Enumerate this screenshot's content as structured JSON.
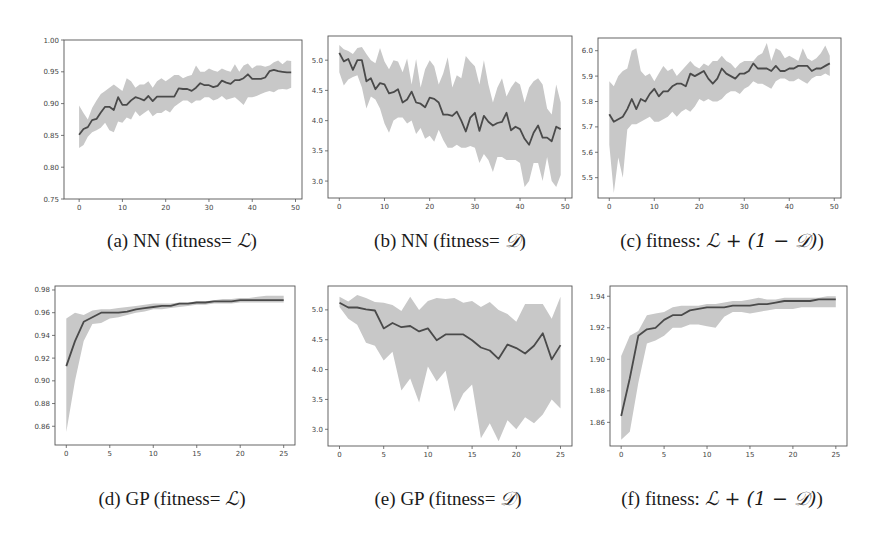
{
  "figure": {
    "background": "#ffffff",
    "line_color": "#4a4a4a",
    "band_color": "#c8c8c8",
    "axes_color": "#555555"
  },
  "captions": [
    {
      "prefix": "(a) NN (fitness= ",
      "math": "ℒ",
      "suffix": ")"
    },
    {
      "prefix": "(b) NN (fitness= ",
      "math": "𝒟",
      "suffix": ")"
    },
    {
      "prefix": "(c) fitness: ",
      "math": "ℒ + (1 − 𝒟)",
      "suffix": ")"
    },
    {
      "prefix": "(d) GP (fitness= ",
      "math": "ℒ",
      "suffix": ")"
    },
    {
      "prefix": "(e) GP (fitness= ",
      "math": "𝒟",
      "suffix": ")"
    },
    {
      "prefix": "(f) fitness: ",
      "math": "ℒ + (1 − 𝒟)",
      "suffix": ")"
    }
  ],
  "chart_data": [
    {
      "id": "a",
      "type": "line",
      "title": "(a) NN (fitness= L)",
      "xlabel": "",
      "ylabel": "",
      "xlim": [
        -3.5,
        51.5
      ],
      "ylim": [
        0.75,
        1.0
      ],
      "xticks": [
        0,
        10,
        20,
        30,
        40,
        50
      ],
      "yticks": [
        0.75,
        0.8,
        0.85,
        0.9,
        0.95,
        1.0
      ],
      "ytick_labels": [
        "0.75",
        "0.80",
        "0.85",
        "0.90",
        "0.95",
        "1.00"
      ],
      "grid": false,
      "x": [
        0,
        1,
        2,
        3,
        4,
        5,
        6,
        7,
        8,
        9,
        10,
        11,
        12,
        13,
        14,
        15,
        16,
        17,
        18,
        19,
        20,
        21,
        22,
        23,
        24,
        25,
        26,
        27,
        28,
        29,
        30,
        31,
        32,
        33,
        34,
        35,
        36,
        37,
        38,
        39,
        40,
        41,
        42,
        43,
        44,
        45,
        46,
        47,
        48,
        49
      ],
      "mean": [
        0.851,
        0.86,
        0.863,
        0.874,
        0.876,
        0.886,
        0.895,
        0.895,
        0.89,
        0.91,
        0.898,
        0.898,
        0.905,
        0.91,
        0.908,
        0.905,
        0.912,
        0.904,
        0.911,
        0.911,
        0.911,
        0.911,
        0.911,
        0.924,
        0.923,
        0.923,
        0.92,
        0.925,
        0.932,
        0.929,
        0.929,
        0.926,
        0.928,
        0.936,
        0.933,
        0.931,
        0.937,
        0.937,
        0.94,
        0.946,
        0.939,
        0.939,
        0.939,
        0.941,
        0.951,
        0.953,
        0.951,
        0.95,
        0.949,
        0.949
      ],
      "upper": [
        0.897,
        0.885,
        0.875,
        0.893,
        0.905,
        0.915,
        0.92,
        0.925,
        0.93,
        0.925,
        0.92,
        0.94,
        0.935,
        0.925,
        0.93,
        0.93,
        0.935,
        0.925,
        0.935,
        0.94,
        0.935,
        0.94,
        0.945,
        0.945,
        0.94,
        0.943,
        0.945,
        0.96,
        0.95,
        0.95,
        0.955,
        0.952,
        0.95,
        0.955,
        0.952,
        0.95,
        0.962,
        0.95,
        0.96,
        0.963,
        0.955,
        0.96,
        0.96,
        0.958,
        0.96,
        0.965,
        0.968,
        0.962,
        0.968,
        0.967
      ],
      "lower": [
        0.83,
        0.835,
        0.848,
        0.855,
        0.858,
        0.862,
        0.87,
        0.858,
        0.855,
        0.872,
        0.87,
        0.878,
        0.875,
        0.888,
        0.88,
        0.885,
        0.89,
        0.88,
        0.885,
        0.885,
        0.89,
        0.886,
        0.895,
        0.9,
        0.905,
        0.905,
        0.9,
        0.905,
        0.905,
        0.91,
        0.91,
        0.905,
        0.907,
        0.912,
        0.906,
        0.908,
        0.91,
        0.904,
        0.898,
        0.91,
        0.91,
        0.912,
        0.915,
        0.918,
        0.92,
        0.918,
        0.922,
        0.923,
        0.922,
        0.925
      ]
    },
    {
      "id": "b",
      "type": "line",
      "title": "(b) NN (fitness= D)",
      "xlabel": "",
      "ylabel": "",
      "xlim": [
        -2.5,
        51.5
      ],
      "ylim": [
        2.72,
        5.4
      ],
      "xticks": [
        0,
        10,
        20,
        30,
        40,
        50
      ],
      "yticks": [
        3.0,
        3.5,
        4.0,
        4.5,
        5.0
      ],
      "ytick_labels": [
        "3.0",
        "3.5",
        "4.0",
        "4.5",
        "5.0"
      ],
      "grid": false,
      "x": [
        0,
        1,
        2,
        3,
        4,
        5,
        6,
        7,
        8,
        9,
        10,
        11,
        12,
        13,
        14,
        15,
        16,
        17,
        18,
        19,
        20,
        21,
        22,
        23,
        24,
        25,
        26,
        27,
        28,
        29,
        30,
        31,
        32,
        33,
        34,
        35,
        36,
        37,
        38,
        39,
        40,
        41,
        42,
        43,
        44,
        45,
        46,
        47,
        48,
        49
      ],
      "mean": [
        5.12,
        4.98,
        5.02,
        4.84,
        5.0,
        5.0,
        4.65,
        4.7,
        4.52,
        4.62,
        4.6,
        4.45,
        4.47,
        4.52,
        4.3,
        4.35,
        4.48,
        4.3,
        4.28,
        4.22,
        4.38,
        4.36,
        4.3,
        4.1,
        4.1,
        4.08,
        4.15,
        4.0,
        3.82,
        4.05,
        4.13,
        3.83,
        4.08,
        3.98,
        3.92,
        3.96,
        3.98,
        4.13,
        3.84,
        3.9,
        3.86,
        3.7,
        3.6,
        3.8,
        3.92,
        3.72,
        3.72,
        3.66,
        3.9,
        3.86
      ],
      "upper": [
        5.25,
        5.18,
        5.15,
        5.1,
        5.2,
        5.22,
        5.1,
        5.0,
        4.95,
        5.2,
        4.98,
        4.85,
        5.0,
        4.98,
        4.8,
        5.03,
        4.6,
        5.02,
        4.55,
        4.85,
        5.0,
        4.9,
        4.6,
        4.78,
        5.05,
        4.55,
        4.75,
        4.7,
        5.07,
        4.98,
        4.9,
        4.6,
        5.0,
        4.6,
        4.3,
        4.55,
        4.7,
        4.4,
        4.55,
        4.65,
        4.6,
        4.3,
        4.55,
        4.65,
        4.7,
        4.6,
        4.2,
        4.1,
        4.6,
        4.3
      ],
      "lower": [
        4.8,
        4.58,
        4.68,
        4.72,
        4.75,
        4.55,
        4.2,
        4.4,
        4.35,
        4.2,
        3.95,
        3.8,
        4.0,
        4.05,
        4.05,
        3.95,
        4.0,
        3.78,
        3.88,
        3.7,
        3.75,
        3.65,
        3.85,
        3.68,
        3.55,
        3.55,
        3.6,
        3.55,
        3.55,
        3.58,
        3.55,
        3.3,
        3.45,
        3.35,
        3.15,
        3.4,
        3.4,
        3.35,
        3.35,
        3.35,
        3.3,
        2.9,
        3.0,
        3.3,
        3.3,
        3.0,
        3.4,
        3.0,
        2.9,
        3.1
      ]
    },
    {
      "id": "c",
      "type": "line",
      "title": "(c) fitness: L + (1 - D))",
      "xlabel": "",
      "ylabel": "",
      "xlim": [
        -2.5,
        51.5
      ],
      "ylim": [
        5.42,
        6.05
      ],
      "xticks": [
        0,
        10,
        20,
        30,
        40,
        50
      ],
      "yticks": [
        5.5,
        5.6,
        5.7,
        5.8,
        5.9,
        6.0
      ],
      "ytick_labels": [
        "5.5",
        "5.6",
        "5.7",
        "5.8",
        "5.9",
        "6.0"
      ],
      "grid": false,
      "x": [
        0,
        1,
        2,
        3,
        4,
        5,
        6,
        7,
        8,
        9,
        10,
        11,
        12,
        13,
        14,
        15,
        16,
        17,
        18,
        19,
        20,
        21,
        22,
        23,
        24,
        25,
        26,
        27,
        28,
        29,
        30,
        31,
        32,
        33,
        34,
        35,
        36,
        37,
        38,
        39,
        40,
        41,
        42,
        43,
        44,
        45,
        46,
        47,
        48,
        49
      ],
      "mean": [
        5.75,
        5.72,
        5.73,
        5.74,
        5.77,
        5.81,
        5.77,
        5.81,
        5.8,
        5.83,
        5.85,
        5.82,
        5.84,
        5.84,
        5.86,
        5.87,
        5.87,
        5.86,
        5.91,
        5.9,
        5.91,
        5.92,
        5.89,
        5.87,
        5.89,
        5.93,
        5.91,
        5.9,
        5.89,
        5.91,
        5.91,
        5.92,
        5.95,
        5.93,
        5.93,
        5.93,
        5.92,
        5.94,
        5.92,
        5.92,
        5.93,
        5.93,
        5.94,
        5.94,
        5.94,
        5.92,
        5.93,
        5.93,
        5.94,
        5.95
      ],
      "upper": [
        5.88,
        5.86,
        5.9,
        5.92,
        5.93,
        6.0,
        6.01,
        5.92,
        5.9,
        5.91,
        5.88,
        5.91,
        5.94,
        5.92,
        5.93,
        5.9,
        5.92,
        5.94,
        5.96,
        5.94,
        5.93,
        5.95,
        5.94,
        5.96,
        5.96,
        5.98,
        5.96,
        5.95,
        5.93,
        5.95,
        5.96,
        5.96,
        5.96,
        5.98,
        5.99,
        6.03,
        5.96,
        6.01,
        6.0,
        5.97,
        5.98,
        5.97,
        5.96,
        6.01,
        5.97,
        5.96,
        5.97,
        5.99,
        6.02,
        5.98
      ],
      "lower": [
        5.63,
        5.44,
        5.58,
        5.5,
        5.69,
        5.71,
        5.71,
        5.72,
        5.73,
        5.74,
        5.72,
        5.72,
        5.73,
        5.74,
        5.76,
        5.74,
        5.76,
        5.77,
        5.76,
        5.78,
        5.81,
        5.8,
        5.81,
        5.8,
        5.8,
        5.81,
        5.83,
        5.84,
        5.84,
        5.83,
        5.85,
        5.86,
        5.88,
        5.87,
        5.87,
        5.86,
        5.85,
        5.88,
        5.89,
        5.89,
        5.88,
        5.88,
        5.89,
        5.88,
        5.87,
        5.89,
        5.9,
        5.9,
        5.91,
        5.9
      ]
    },
    {
      "id": "d",
      "type": "line",
      "title": "(d) GP (fitness= L)",
      "xlabel": "",
      "ylabel": "",
      "xlim": [
        -1.3,
        26.3
      ],
      "ylim": [
        0.8435,
        0.9835
      ],
      "xticks": [
        0,
        5,
        10,
        15,
        20,
        25
      ],
      "yticks": [
        0.86,
        0.88,
        0.9,
        0.92,
        0.94,
        0.96,
        0.98
      ],
      "ytick_labels": [
        "0.86",
        "0.88",
        "0.90",
        "0.92",
        "0.94",
        "0.96",
        "0.98"
      ],
      "grid": false,
      "x": [
        0,
        1,
        2,
        3,
        4,
        5,
        6,
        7,
        8,
        9,
        10,
        11,
        12,
        13,
        14,
        15,
        16,
        17,
        18,
        19,
        20,
        21,
        22,
        23,
        24,
        25
      ],
      "mean": [
        0.913,
        0.935,
        0.952,
        0.956,
        0.96,
        0.96,
        0.96,
        0.961,
        0.963,
        0.964,
        0.965,
        0.966,
        0.966,
        0.968,
        0.968,
        0.969,
        0.969,
        0.97,
        0.97,
        0.97,
        0.971,
        0.971,
        0.971,
        0.971,
        0.971,
        0.971
      ],
      "upper": [
        0.955,
        0.96,
        0.958,
        0.962,
        0.963,
        0.963,
        0.964,
        0.965,
        0.966,
        0.967,
        0.968,
        0.968,
        0.968,
        0.969,
        0.969,
        0.97,
        0.97,
        0.971,
        0.972,
        0.972,
        0.973,
        0.973,
        0.974,
        0.975,
        0.975,
        0.975
      ],
      "lower": [
        0.855,
        0.9,
        0.935,
        0.95,
        0.951,
        0.955,
        0.956,
        0.958,
        0.96,
        0.961,
        0.963,
        0.963,
        0.964,
        0.965,
        0.966,
        0.967,
        0.967,
        0.968,
        0.968,
        0.968,
        0.969,
        0.969,
        0.969,
        0.969,
        0.969,
        0.969
      ]
    },
    {
      "id": "e",
      "type": "line",
      "title": "(e) GP (fitness= D)",
      "xlabel": "",
      "ylabel": "",
      "xlim": [
        -1.3,
        26.3
      ],
      "ylim": [
        2.72,
        5.4
      ],
      "xticks": [
        0,
        5,
        10,
        15,
        20,
        25
      ],
      "yticks": [
        3.0,
        3.5,
        4.0,
        4.5,
        5.0
      ],
      "ytick_labels": [
        "3.0",
        "3.5",
        "4.0",
        "4.5",
        "5.0"
      ],
      "grid": false,
      "x": [
        0,
        1,
        2,
        3,
        4,
        5,
        6,
        7,
        8,
        9,
        10,
        11,
        12,
        13,
        14,
        15,
        16,
        17,
        18,
        19,
        20,
        21,
        22,
        23,
        24,
        25
      ],
      "mean": [
        5.12,
        5.04,
        5.04,
        5.01,
        4.99,
        4.69,
        4.78,
        4.71,
        4.73,
        4.64,
        4.69,
        4.49,
        4.59,
        4.59,
        4.59,
        4.49,
        4.37,
        4.32,
        4.18,
        4.42,
        4.36,
        4.27,
        4.4,
        4.61,
        4.17,
        4.41
      ],
      "upper": [
        5.22,
        5.14,
        5.25,
        5.2,
        5.13,
        5.12,
        5.08,
        4.98,
        5.22,
        5.0,
        5.15,
        5.2,
        5.18,
        5.2,
        5.12,
        5.15,
        5.05,
        5.13,
        5.0,
        4.93,
        4.8,
        5.1,
        5.1,
        5.1,
        4.85,
        5.22
      ],
      "lower": [
        5.05,
        4.85,
        4.75,
        4.45,
        4.4,
        4.15,
        4.3,
        3.65,
        3.85,
        3.45,
        4.05,
        3.8,
        3.98,
        3.3,
        3.6,
        3.75,
        2.85,
        3.1,
        2.8,
        3.15,
        3.0,
        3.2,
        3.1,
        3.25,
        3.5,
        3.35
      ]
    },
    {
      "id": "f",
      "type": "line",
      "title": "(f) fitness: L + (1 - D))",
      "xlabel": "",
      "ylabel": "",
      "xlim": [
        -1.3,
        26.3
      ],
      "ylim": [
        1.845,
        1.9465
      ],
      "xticks": [
        0,
        5,
        10,
        15,
        20,
        25
      ],
      "yticks": [
        1.86,
        1.88,
        1.9,
        1.92,
        1.94
      ],
      "ytick_labels": [
        "1.86",
        "1.88",
        "1.90",
        "1.92",
        "1.94"
      ],
      "grid": false,
      "x": [
        0,
        1,
        2,
        3,
        4,
        5,
        6,
        7,
        8,
        9,
        10,
        11,
        12,
        13,
        14,
        15,
        16,
        17,
        18,
        19,
        20,
        21,
        22,
        23,
        24,
        25
      ],
      "mean": [
        1.864,
        1.888,
        1.915,
        1.919,
        1.92,
        1.925,
        1.928,
        1.928,
        1.931,
        1.932,
        1.933,
        1.933,
        1.933,
        1.934,
        1.934,
        1.934,
        1.935,
        1.935,
        1.936,
        1.937,
        1.937,
        1.937,
        1.937,
        1.938,
        1.938,
        1.938
      ],
      "upper": [
        1.902,
        1.915,
        1.918,
        1.928,
        1.929,
        1.93,
        1.933,
        1.934,
        1.934,
        1.934,
        1.935,
        1.935,
        1.936,
        1.937,
        1.937,
        1.938,
        1.939,
        1.938,
        1.938,
        1.939,
        1.939,
        1.939,
        1.939,
        1.939,
        1.94,
        1.94
      ],
      "lower": [
        1.849,
        1.854,
        1.885,
        1.91,
        1.912,
        1.915,
        1.92,
        1.92,
        1.922,
        1.922,
        1.921,
        1.92,
        1.927,
        1.93,
        1.93,
        1.929,
        1.93,
        1.931,
        1.932,
        1.932,
        1.932,
        1.933,
        1.933,
        1.933,
        1.933,
        1.933
      ]
    }
  ]
}
